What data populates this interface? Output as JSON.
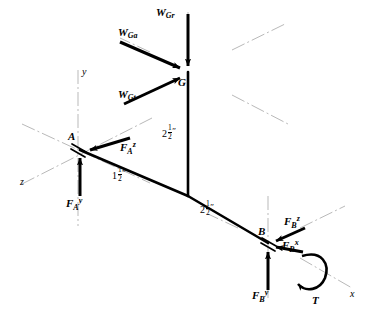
{
  "figure": {
    "type": "free-body-diagram",
    "stroke_color": "#000000",
    "axis_color": "#b5b5b5",
    "background": "#ffffff"
  },
  "points": [
    {
      "id": "G",
      "label": "G",
      "x": 188,
      "y": 72
    },
    {
      "id": "A",
      "label": "A",
      "x": 78,
      "y": 148
    },
    {
      "id": "B",
      "label": "B",
      "x": 268,
      "y": 243
    }
  ],
  "axes": [
    {
      "name": "y",
      "label": "y"
    },
    {
      "name": "z",
      "label": "z"
    },
    {
      "name": "x",
      "label": "x"
    }
  ],
  "forces": [
    {
      "id": "W_Gr",
      "base": "W",
      "sub": "Gr",
      "sup": "",
      "point": "G",
      "direction": "down"
    },
    {
      "id": "W_Ga",
      "base": "W",
      "sub": "Ga",
      "sup": "",
      "point": "G",
      "direction": "down-right"
    },
    {
      "id": "W_Gt",
      "base": "W",
      "sub": "Gt",
      "sup": "",
      "point": "G",
      "direction": "up-right"
    },
    {
      "id": "F_A_z",
      "base": "F",
      "sub": "A",
      "sup": "z",
      "point": "A",
      "direction": "left"
    },
    {
      "id": "F_A_y",
      "base": "F",
      "sub": "A",
      "sup": "y",
      "point": "A",
      "direction": "up"
    },
    {
      "id": "F_B_z",
      "base": "F",
      "sub": "B",
      "sup": "z",
      "point": "B",
      "direction": "down-left"
    },
    {
      "id": "F_B_x",
      "base": "F",
      "sub": "B",
      "sup": "x",
      "point": "B",
      "direction": "left"
    },
    {
      "id": "F_B_y",
      "base": "F",
      "sub": "B",
      "sup": "y",
      "point": "B",
      "direction": "up"
    }
  ],
  "torque": {
    "label": "T",
    "point": "B",
    "sense": "about x-axis"
  },
  "dimensions": [
    {
      "id": "dim-A",
      "whole": "1",
      "num": "1",
      "den": "2",
      "unit": "″",
      "member": "A offset"
    },
    {
      "id": "dim-vertical",
      "whole": "2",
      "num": "1",
      "den": "2",
      "unit": "″",
      "member": "G to A vertical"
    },
    {
      "id": "dim-diagonal",
      "whole": "2",
      "num": "1",
      "den": "2",
      "unit": "″",
      "member": "A to B diagonal"
    }
  ]
}
